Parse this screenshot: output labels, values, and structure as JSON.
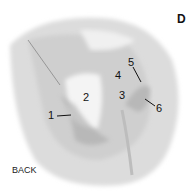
{
  "figure": {
    "panel_letter": "D",
    "side_label": "BACK",
    "labels": [
      {
        "id": "1",
        "text": "1"
      },
      {
        "id": "2",
        "text": "2"
      },
      {
        "id": "3",
        "text": "3"
      },
      {
        "id": "4",
        "text": "4"
      },
      {
        "id": "5",
        "text": "5"
      },
      {
        "id": "6",
        "text": "6"
      }
    ],
    "colors": {
      "specimen": "#d4d4d4",
      "dark": "#a8a8a8",
      "light": "#f2f2f2"
    }
  }
}
